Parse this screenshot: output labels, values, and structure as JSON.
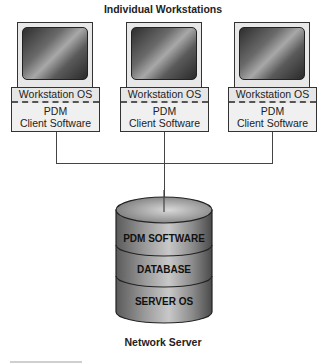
{
  "diagram": {
    "top_title": "Individual Workstations",
    "bottom_title": "Network Server",
    "workstations": [
      {
        "os_label": "Workstation OS",
        "client_line1": "PDM",
        "client_line2": "Client Software"
      },
      {
        "os_label": "Workstation OS",
        "client_line1": "PDM",
        "client_line2": "Client Software"
      },
      {
        "os_label": "Workstation OS",
        "client_line1": "PDM",
        "client_line2": "Client Software"
      }
    ],
    "server_layers": [
      "PDM SOFTWARE",
      "DATABASE",
      "SERVER OS"
    ]
  }
}
